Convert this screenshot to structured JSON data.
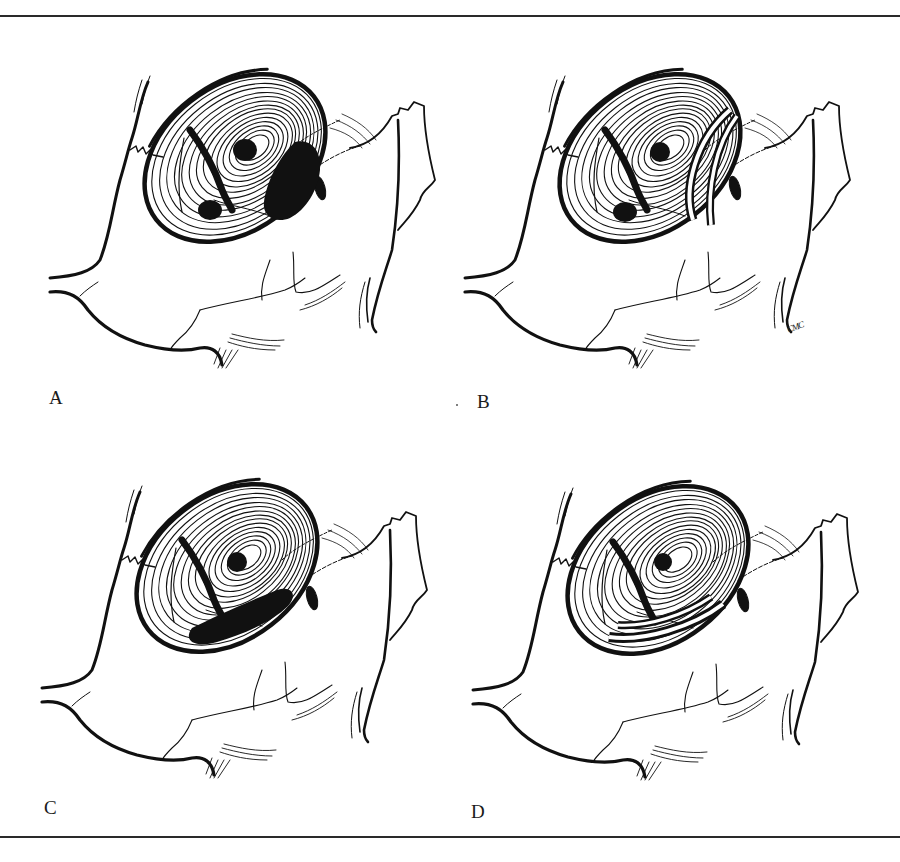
{
  "figure": {
    "panels": [
      {
        "id": "A",
        "label": "A",
        "feature": "posterior-superior perforation"
      },
      {
        "id": "B",
        "label": "B",
        "feature": "posterior crescent graft"
      },
      {
        "id": "C",
        "label": "C",
        "feature": "inferior perforation"
      },
      {
        "id": "D",
        "label": "D",
        "feature": "inferior crescent graft"
      }
    ],
    "signature": "CMC",
    "colors": {
      "ink": "#111111",
      "paper": "#ffffff",
      "rule": "#2a2a2a"
    }
  }
}
